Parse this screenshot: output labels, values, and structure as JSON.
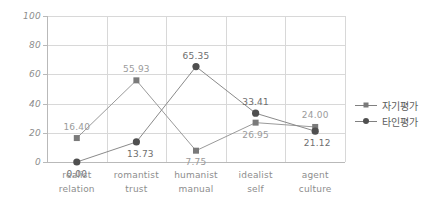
{
  "chart_data": {
    "type": "line",
    "title": "",
    "subtitle": "",
    "xlabel": "",
    "ylabel": "",
    "ylim": [
      0,
      100
    ],
    "yticks": [
      0,
      20,
      40,
      60,
      80,
      100
    ],
    "grid": true,
    "legend_position": "right",
    "categories": [
      {
        "line1": "realist",
        "line2": "relation"
      },
      {
        "line1": "romantist",
        "line2": "trust"
      },
      {
        "line1": "humanist",
        "line2": "manual"
      },
      {
        "line1": "idealist",
        "line2": "self"
      },
      {
        "line1": "agent",
        "line2": "culture"
      }
    ],
    "series": [
      {
        "name": "자기평가",
        "marker": "square",
        "color": "#7a7a7a",
        "line_color": "#9a9a9a",
        "values": [
          16.4,
          55.93,
          7.75,
          26.95,
          24.0
        ],
        "labels": [
          "16.40",
          "55.93",
          "7.75",
          "26.95",
          "24.00"
        ]
      },
      {
        "name": "타인평가",
        "marker": "circle",
        "color": "#4f4f4f",
        "line_color": "#8a8a8a",
        "values": [
          0.0,
          13.73,
          65.35,
          33.41,
          21.12
        ],
        "labels": [
          "0.00",
          "13.73",
          "65.35",
          "33.41",
          "21.12"
        ]
      }
    ]
  },
  "axis": {
    "y_tick_labels": [
      "100",
      "80",
      "60",
      "40",
      "20",
      "0"
    ]
  },
  "legend": {
    "items": [
      {
        "label": "자기평가"
      },
      {
        "label": "타인평가"
      }
    ]
  }
}
